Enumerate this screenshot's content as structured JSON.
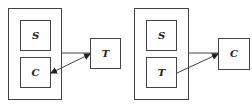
{
  "diagrams": [
    {
      "name": "left",
      "inner_top": "S",
      "inner_bottom": "C",
      "external": "T",
      "connections": [
        {
          "from": "container",
          "to": "T",
          "type": "line"
        },
        {
          "from": "C",
          "to": "T",
          "type": "double-arrow"
        }
      ]
    },
    {
      "name": "right",
      "inner_top": "S",
      "inner_bottom": "T",
      "external": "C",
      "connections": [
        {
          "from": "container",
          "to": "C",
          "type": "arrow-tip"
        },
        {
          "from": "T",
          "to": "C",
          "type": "arrow"
        }
      ]
    }
  ],
  "colors": {
    "stroke": "#444444",
    "text": "#222222"
  }
}
